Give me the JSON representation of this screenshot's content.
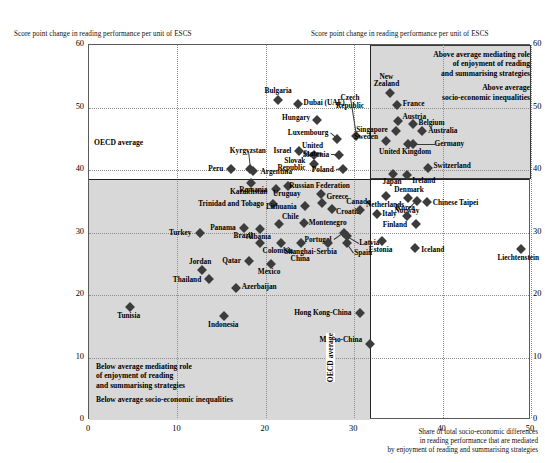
{
  "axes": {
    "y_title_left": "Score point change in reading performance per unit of ESCS",
    "y_title_right": "Score point change in reading performance per unit of ESCS",
    "x_title_line1": "Share of total socio-economic differences",
    "x_title_line2": "in reading performance that are mediated",
    "x_title_line3": "by enjoyment of reading and summarising strategies",
    "y_ticks": [
      "0",
      "10",
      "20",
      "30",
      "40",
      "50",
      "60"
    ],
    "x_ticks": [
      "0",
      "10",
      "20",
      "30",
      "40",
      "50"
    ],
    "oecd_average_horizontal_label": "OECD average",
    "oecd_average_vertical_label": "OECD average"
  },
  "notes": {
    "upper_right_line1": "Above average mediating role",
    "upper_right_line2": "of enjoyment of reading",
    "upper_right_line3": "and summarising strategies",
    "upper_right_line4": "Above average",
    "upper_right_line5": "socio-economic inequalities",
    "lower_left_line1": "Below average mediating role",
    "lower_left_line2": "of enjoyment of reading",
    "lower_left_line3": "and summarising strategies",
    "lower_left_line4": "Below average socio-economic inequalities"
  },
  "colors": {
    "marker": "#3c3c3c",
    "shade": "#d8d8d8",
    "axis": "#5a5a5a",
    "reference_line": "#222222"
  },
  "chart_data": {
    "type": "scatter",
    "title": "",
    "xlabel": "Share of total socio-economic differences in reading performance that are mediated by enjoyment of reading and summarising strategies",
    "ylabel": "Score point change in reading performance per unit of ESCS",
    "xlim": [
      0,
      50
    ],
    "ylim": [
      0,
      60
    ],
    "grid": true,
    "oecd_average_x": 31.8,
    "oecd_average_y": 38.6,
    "points": [
      {
        "name": "Bulgaria",
        "x": 21.4,
        "y": 51.2
      },
      {
        "name": "Dubai (UAE)",
        "x": 23.6,
        "y": 50.5
      },
      {
        "name": "Hungary",
        "x": 25.8,
        "y": 48.0
      },
      {
        "name": "Czech Republic",
        "x": 30.2,
        "y": 45.4
      },
      {
        "name": "New Zealand",
        "x": 34.1,
        "y": 52.4
      },
      {
        "name": "France",
        "x": 34.8,
        "y": 50.4
      },
      {
        "name": "Austria",
        "x": 34.9,
        "y": 47.8
      },
      {
        "name": "Belgium",
        "x": 36.6,
        "y": 47.3
      },
      {
        "name": "Australia",
        "x": 37.7,
        "y": 46.2
      },
      {
        "name": "Singapore",
        "x": 34.7,
        "y": 46.2
      },
      {
        "name": "Sweden",
        "x": 33.6,
        "y": 44.6
      },
      {
        "name": "Germany",
        "x": 36.6,
        "y": 44.1
      },
      {
        "name": "United Kingdom",
        "x": 36.1,
        "y": 44.1
      },
      {
        "name": "Luxembourg",
        "x": 28.1,
        "y": 45.0
      },
      {
        "name": "Slovenia",
        "x": 28.3,
        "y": 42.4
      },
      {
        "name": "Israel",
        "x": 23.8,
        "y": 43.0
      },
      {
        "name": "United States",
        "x": 25.4,
        "y": 42.4
      },
      {
        "name": "Slovak Republic",
        "x": 25.5,
        "y": 41.0
      },
      {
        "name": "Poland",
        "x": 28.7,
        "y": 40.1
      },
      {
        "name": "Switzerland",
        "x": 38.3,
        "y": 40.4
      },
      {
        "name": "Japan",
        "x": 34.4,
        "y": 39.3
      },
      {
        "name": "Ireland",
        "x": 36.0,
        "y": 39.2
      },
      {
        "name": "Kyrgyzstan",
        "x": 18.2,
        "y": 40.2
      },
      {
        "name": "Peru",
        "x": 16.1,
        "y": 40.2
      },
      {
        "name": "Argentina",
        "x": 18.6,
        "y": 39.8
      },
      {
        "name": "Kazakhstan",
        "x": 18.3,
        "y": 37.9
      },
      {
        "name": "Romania",
        "x": 21.1,
        "y": 37.0
      },
      {
        "name": "Uruguay",
        "x": 22.5,
        "y": 37.4
      },
      {
        "name": "Russian Federation",
        "x": 26.2,
        "y": 36.1
      },
      {
        "name": "Denmark",
        "x": 36.1,
        "y": 35.5
      },
      {
        "name": "Chinese Taipei",
        "x": 38.2,
        "y": 34.9
      },
      {
        "name": "Netherlands",
        "x": 33.6,
        "y": 35.8
      },
      {
        "name": "Norway",
        "x": 37.1,
        "y": 35.1
      },
      {
        "name": "Trinidad and Tobago",
        "x": 20.8,
        "y": 34.6
      },
      {
        "name": "Lithuania",
        "x": 24.4,
        "y": 34.2
      },
      {
        "name": "Greece",
        "x": 26.4,
        "y": 34.7
      },
      {
        "name": "Croatia",
        "x": 27.5,
        "y": 33.7
      },
      {
        "name": "Canada",
        "x": 30.6,
        "y": 33.6
      },
      {
        "name": "Italy",
        "x": 32.6,
        "y": 33.0
      },
      {
        "name": "Korea",
        "x": 36.0,
        "y": 32.7
      },
      {
        "name": "Finland",
        "x": 37.0,
        "y": 31.3
      },
      {
        "name": "Montenegro",
        "x": 24.3,
        "y": 31.6
      },
      {
        "name": "Chile",
        "x": 21.5,
        "y": 31.3
      },
      {
        "name": "Albania",
        "x": 19.3,
        "y": 30.6
      },
      {
        "name": "Panama",
        "x": 17.5,
        "y": 30.8
      },
      {
        "name": "Turkey",
        "x": 12.5,
        "y": 29.9
      },
      {
        "name": "Brazil",
        "x": 19.3,
        "y": 28.4
      },
      {
        "name": "Colombia",
        "x": 21.7,
        "y": 28.3
      },
      {
        "name": "Portugal",
        "x": 28.8,
        "y": 30.0
      },
      {
        "name": "Latvia",
        "x": 29.2,
        "y": 29.5
      },
      {
        "name": "Spain",
        "x": 29.2,
        "y": 28.4
      },
      {
        "name": "Serbia",
        "x": 27.0,
        "y": 28.4
      },
      {
        "name": "Shanghai-China",
        "x": 24.0,
        "y": 28.4
      },
      {
        "name": "Estonia",
        "x": 33.1,
        "y": 28.6
      },
      {
        "name": "Iceland",
        "x": 36.9,
        "y": 27.6
      },
      {
        "name": "Liechtenstein",
        "x": 48.9,
        "y": 27.4
      },
      {
        "name": "Qatar",
        "x": 18.1,
        "y": 25.4
      },
      {
        "name": "Mexico",
        "x": 20.6,
        "y": 24.9
      },
      {
        "name": "Jordan",
        "x": 12.8,
        "y": 24.0
      },
      {
        "name": "Thailand",
        "x": 13.6,
        "y": 22.6
      },
      {
        "name": "Azerbaijan",
        "x": 16.6,
        "y": 21.1
      },
      {
        "name": "Tunisia",
        "x": 4.6,
        "y": 18.1
      },
      {
        "name": "Indonesia",
        "x": 15.3,
        "y": 16.6
      },
      {
        "name": "Hong Kong-China",
        "x": 30.6,
        "y": 17.1
      },
      {
        "name": "Macao-China",
        "x": 31.8,
        "y": 12.1
      }
    ]
  }
}
